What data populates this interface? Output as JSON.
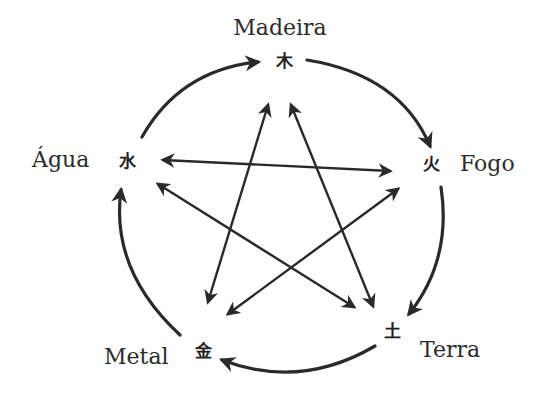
{
  "diagram": {
    "elements": [
      {
        "id": "madeira",
        "label": "Madeira",
        "glyph": "木"
      },
      {
        "id": "fogo",
        "label": "Fogo",
        "glyph": "火"
      },
      {
        "id": "terra",
        "label": "Terra",
        "glyph": "土"
      },
      {
        "id": "metal",
        "label": "Metal",
        "glyph": "金"
      },
      {
        "id": "agua",
        "label": "Água",
        "glyph": "水"
      }
    ],
    "generating_cycle": [
      {
        "from": "agua",
        "to": "madeira"
      },
      {
        "from": "madeira",
        "to": "fogo"
      },
      {
        "from": "fogo",
        "to": "terra"
      },
      {
        "from": "terra",
        "to": "metal"
      },
      {
        "from": "metal",
        "to": "agua"
      }
    ],
    "controlling_links": [
      {
        "a": "agua",
        "b": "fogo",
        "bidirectional": true
      },
      {
        "a": "madeira",
        "b": "metal",
        "bidirectional": true
      },
      {
        "a": "madeira",
        "b": "terra",
        "bidirectional": true
      },
      {
        "a": "agua",
        "b": "terra",
        "bidirectional": true
      },
      {
        "a": "fogo",
        "b": "metal",
        "bidirectional": true
      }
    ],
    "colors": {
      "ink": "#2a2a2a",
      "background": "#ffffff"
    }
  }
}
